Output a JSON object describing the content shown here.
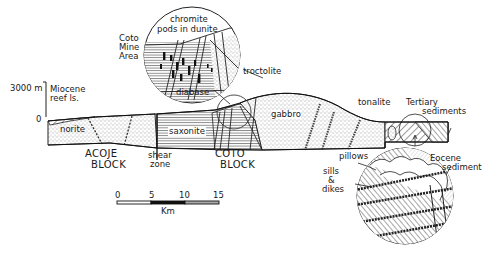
{
  "figure": {
    "type": "geologic-cross-section",
    "vertical_scale": {
      "top_label": "3000 m",
      "bottom_label": "0"
    },
    "horizontal_scale": {
      "ticks": [
        "0",
        "5",
        "10",
        "15"
      ],
      "unit": "Km"
    },
    "blocks": [
      {
        "line1": "ACOJE",
        "line2": "BLOCK"
      },
      {
        "line1": "COTO",
        "line2": "BLOCK"
      }
    ],
    "units": {
      "miocene": {
        "line1": "Miocene",
        "line2": "reef ls."
      },
      "norite": "norite",
      "saxonite": "saxonite",
      "gabbro": "gabbro",
      "tonalite": "tonalite",
      "tertiary": {
        "line1": "Tertiary",
        "line2": "sediments"
      },
      "shear_zone": {
        "line1": "shear",
        "line2": "zone"
      }
    },
    "inset_upper": {
      "area_label": {
        "line1": "Coto",
        "line2": "Mine",
        "line3": "Area"
      },
      "chromite": {
        "line1": "chromite",
        "line2": "pods in dunite"
      },
      "troctolite": "troctolite",
      "diabase": "diabase"
    },
    "inset_lower": {
      "pillows": "pillows",
      "sills": {
        "line1": "sills",
        "line2": "&",
        "line3": "dikes"
      },
      "eocene": {
        "line1": "Eocene",
        "line2": "sediment"
      }
    },
    "colors": {
      "ink": "#1a1a1a",
      "background": "#ffffff"
    }
  }
}
